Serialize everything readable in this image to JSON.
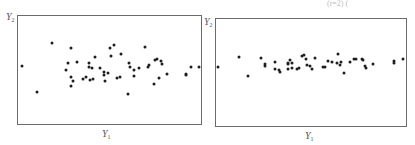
{
  "figure": {
    "top_right_fragment": "(r=2)        (",
    "panels": [
      {
        "id": "left",
        "y_label": "Y",
        "y_label_sub": "2",
        "x_label": "Y",
        "x_label_sub": "1",
        "description": "Scatter with wider vertical spread"
      },
      {
        "id": "right",
        "y_label": "Y",
        "y_label_sub": "2",
        "x_label": "Y",
        "x_label_sub": "1",
        "description": "Scatter with narrow vertical spread"
      }
    ]
  },
  "chart_data": [
    {
      "type": "scatter",
      "title": "",
      "xlabel": "Y1",
      "ylabel": "Y2",
      "grid": false,
      "axis_ticks": false,
      "frame_px": {
        "x0": 17,
        "y0": 15,
        "x1": 201,
        "y1": 124
      },
      "points_px": [
        [
          22,
          66
        ],
        [
          37,
          92
        ],
        [
          52,
          43
        ],
        [
          71,
          48
        ],
        [
          68,
          63
        ],
        [
          77,
          62
        ],
        [
          66,
          70
        ],
        [
          71,
          77
        ],
        [
          73,
          81
        ],
        [
          71,
          86
        ],
        [
          83,
          79
        ],
        [
          86,
          77
        ],
        [
          90,
          80
        ],
        [
          93,
          79
        ],
        [
          89,
          63
        ],
        [
          89,
          67
        ],
        [
          92,
          68
        ],
        [
          95,
          57
        ],
        [
          100,
          68
        ],
        [
          104,
          72
        ],
        [
          104,
          75
        ],
        [
          108,
          73
        ],
        [
          105,
          81
        ],
        [
          110,
          48
        ],
        [
          114,
          45
        ],
        [
          111,
          56
        ],
        [
          117,
          78
        ],
        [
          120,
          77
        ],
        [
          121,
          54
        ],
        [
          129,
          63
        ],
        [
          130,
          67
        ],
        [
          134,
          70
        ],
        [
          134,
          76
        ],
        [
          139,
          68
        ],
        [
          128,
          94
        ],
        [
          145,
          47
        ],
        [
          148,
          67
        ],
        [
          149,
          65
        ],
        [
          155,
          60
        ],
        [
          157,
          59
        ],
        [
          161,
          61
        ],
        [
          162,
          64
        ],
        [
          154,
          84
        ],
        [
          159,
          78
        ],
        [
          167,
          74
        ],
        [
          186,
          74
        ],
        [
          186,
          75
        ],
        [
          191,
          67
        ],
        [
          199,
          67
        ]
      ]
    },
    {
      "type": "scatter",
      "title": "",
      "xlabel": "Y1",
      "ylabel": "Y2",
      "grid": false,
      "axis_ticks": false,
      "frame_px": {
        "x0": 215,
        "y0": 18,
        "x1": 406,
        "y1": 126
      },
      "points_px": [
        [
          218,
          67
        ],
        [
          239,
          57
        ],
        [
          248,
          76
        ],
        [
          261,
          58
        ],
        [
          265,
          64
        ],
        [
          265,
          66
        ],
        [
          275,
          62
        ],
        [
          275,
          69
        ],
        [
          279,
          70
        ],
        [
          280,
          72
        ],
        [
          288,
          63
        ],
        [
          290,
          60
        ],
        [
          288,
          64
        ],
        [
          292,
          63
        ],
        [
          288,
          69
        ],
        [
          292,
          68
        ],
        [
          297,
          69
        ],
        [
          299,
          68
        ],
        [
          302,
          56
        ],
        [
          304,
          55
        ],
        [
          306,
          59
        ],
        [
          307,
          65
        ],
        [
          310,
          66
        ],
        [
          312,
          69
        ],
        [
          315,
          58
        ],
        [
          323,
          67
        ],
        [
          325,
          67
        ],
        [
          328,
          61
        ],
        [
          332,
          62
        ],
        [
          338,
          54
        ],
        [
          337,
          63
        ],
        [
          340,
          65
        ],
        [
          341,
          62
        ],
        [
          344,
          73
        ],
        [
          350,
          62
        ],
        [
          354,
          59
        ],
        [
          356,
          59
        ],
        [
          362,
          59
        ],
        [
          363,
          60
        ],
        [
          365,
          66
        ],
        [
          366,
          68
        ],
        [
          373,
          64
        ],
        [
          394,
          63
        ],
        [
          394,
          61
        ],
        [
          403,
          59
        ]
      ]
    }
  ]
}
